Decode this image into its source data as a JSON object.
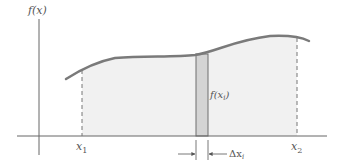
{
  "diagram": {
    "y_axis_label": "f(x)",
    "x1_label": "x",
    "x1_sub": "1",
    "x2_label": "x",
    "x2_sub": "2",
    "strip_label": "f(x",
    "strip_label_sub": "i",
    "strip_label_close": ")",
    "delta_label": "Δx",
    "delta_sub": "i",
    "colors": {
      "curve": "#7a7a7a",
      "area_fill": "#f1f1f1",
      "strip_fill": "#d4d4d4",
      "strip_edge": "#6e6e6e",
      "axis": "#666666",
      "dashed": "#777777"
    }
  }
}
